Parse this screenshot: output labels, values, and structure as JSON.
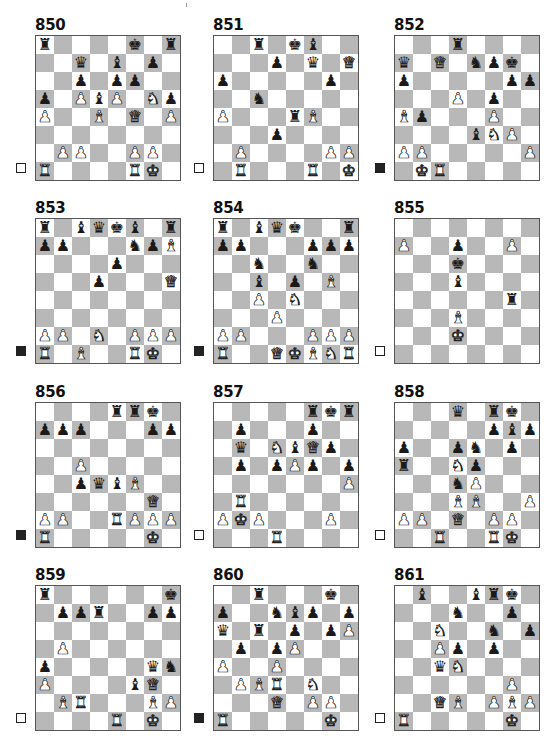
{
  "page": {
    "background": "#ffffff",
    "dark_square_color": "#b8b8b8",
    "light_square_color": "#ffffff"
  },
  "legend": {
    "white_to_move_icon": "white-square",
    "black_to_move_icon": "black-square"
  },
  "puzzles": [
    {
      "number": "850",
      "to_move": "white",
      "position": {
        "8": {
          "a": "bR",
          "f": "bK",
          "h": "bR"
        },
        "7": {
          "c": "bQ",
          "e": "bB",
          "g": "bP"
        },
        "6": {
          "c": "bP",
          "e": "bP",
          "f": "bP"
        },
        "5": {
          "a": "bP",
          "c": "wP",
          "d": "bB",
          "e": "wP",
          "g": "wN",
          "h": "bP"
        },
        "4": {
          "a": "wP",
          "d": "wB",
          "f": "wQ",
          "h": "wP"
        },
        "3": {},
        "2": {
          "b": "wP",
          "c": "wP",
          "f": "wP",
          "g": "wP"
        },
        "1": {
          "a": "wR",
          "f": "wR",
          "g": "wK"
        }
      }
    },
    {
      "number": "851",
      "to_move": "white",
      "position": {
        "8": {
          "c": "bR",
          "e": "bK",
          "f": "bB"
        },
        "7": {
          "d": "bP",
          "f": "bQ",
          "h": "wQ"
        },
        "6": {
          "a": "bP",
          "g": "bP"
        },
        "5": {
          "c": "bN"
        },
        "4": {
          "a": "wP",
          "e": "bR",
          "f": "wB"
        },
        "3": {
          "d": "bP"
        },
        "2": {
          "b": "wP",
          "g": "wP",
          "h": "wP"
        },
        "1": {
          "b": "wR",
          "f": "wR",
          "h": "wK"
        }
      }
    },
    {
      "number": "852",
      "to_move": "black",
      "position": {
        "8": {
          "d": "bR"
        },
        "7": {
          "a": "bQ",
          "c": "wQ",
          "e": "bN",
          "f": "bP",
          "g": "bK"
        },
        "6": {
          "a": "bP",
          "g": "bP",
          "h": "bP"
        },
        "5": {
          "d": "wP",
          "f": "bP"
        },
        "4": {
          "a": "wB",
          "b": "bP",
          "f": "wP"
        },
        "3": {
          "e": "bB",
          "f": "wN",
          "g": "wP"
        },
        "2": {
          "a": "wP",
          "b": "wP",
          "h": "wP"
        },
        "1": {
          "b": "wK",
          "c": "wR"
        }
      }
    },
    {
      "number": "853",
      "to_move": "black",
      "position": {
        "8": {
          "a": "bR",
          "c": "bB",
          "d": "bQ",
          "e": "bK",
          "f": "bB",
          "h": "bR"
        },
        "7": {
          "a": "bP",
          "b": "bP",
          "f": "bN",
          "g": "bP",
          "h": "wB"
        },
        "6": {
          "e": "bP"
        },
        "5": {
          "d": "bP",
          "h": "wQ"
        },
        "4": {},
        "3": {},
        "2": {
          "a": "wP",
          "b": "wP",
          "d": "wN",
          "f": "wP",
          "g": "wP",
          "h": "wP"
        },
        "1": {
          "a": "wR",
          "c": "wB",
          "f": "wR",
          "g": "wK"
        }
      }
    },
    {
      "number": "854",
      "to_move": "black",
      "position": {
        "8": {
          "a": "bR",
          "c": "bB",
          "d": "bQ",
          "e": "bK",
          "h": "bR"
        },
        "7": {
          "a": "bP",
          "b": "bP",
          "f": "bP",
          "g": "bP",
          "h": "bP"
        },
        "6": {
          "c": "bN",
          "f": "bN"
        },
        "5": {
          "c": "bB",
          "e": "bP",
          "g": "wB"
        },
        "4": {
          "c": "wP",
          "e": "wN"
        },
        "3": {
          "d": "wP"
        },
        "2": {
          "a": "wP",
          "b": "wP",
          "f": "wP",
          "g": "wP",
          "h": "wP"
        },
        "1": {
          "a": "wR",
          "d": "wQ",
          "e": "wK",
          "f": "wB",
          "g": "wN",
          "h": "wR"
        }
      }
    },
    {
      "number": "855",
      "to_move": "white",
      "position": {
        "8": {},
        "7": {
          "a": "wP",
          "d": "bP",
          "g": "wP"
        },
        "6": {
          "d": "bK"
        },
        "5": {
          "d": "bB"
        },
        "4": {
          "g": "bR"
        },
        "3": {
          "d": "wB"
        },
        "2": {
          "d": "wK"
        },
        "1": {}
      }
    },
    {
      "number": "856",
      "to_move": "black",
      "position": {
        "8": {
          "e": "bR",
          "f": "bR",
          "g": "bK"
        },
        "7": {
          "a": "bP",
          "b": "bP",
          "c": "bP",
          "g": "bP",
          "h": "bP"
        },
        "6": {},
        "5": {
          "c": "wP"
        },
        "4": {
          "c": "bP",
          "d": "bQ",
          "e": "bB",
          "f": "wB"
        },
        "3": {
          "g": "wQ"
        },
        "2": {
          "a": "wP",
          "b": "wP",
          "e": "wR",
          "f": "wP",
          "g": "wP",
          "h": "wP"
        },
        "1": {
          "a": "wR",
          "g": "wK"
        }
      }
    },
    {
      "number": "857",
      "to_move": "white",
      "position": {
        "8": {
          "f": "bR",
          "g": "bK",
          "h": "bR"
        },
        "7": {
          "b": "bP",
          "f": "bP"
        },
        "6": {
          "b": "bQ",
          "d": "wN",
          "e": "bB",
          "f": "wQ",
          "g": "bP"
        },
        "5": {
          "b": "bP",
          "d": "bP",
          "e": "wP",
          "f": "bP",
          "h": "bP"
        },
        "4": {
          "h": "wP"
        },
        "3": {
          "b": "wR"
        },
        "2": {
          "a": "wP",
          "b": "wK",
          "c": "wP",
          "g": "wP"
        },
        "1": {
          "d": "wR"
        }
      }
    },
    {
      "number": "858",
      "to_move": "white",
      "position": {
        "8": {
          "d": "bQ",
          "f": "bR",
          "g": "bK"
        },
        "7": {
          "f": "bP",
          "g": "bB",
          "h": "bP"
        },
        "6": {
          "a": "bP",
          "d": "bP",
          "e": "bN",
          "g": "bP"
        },
        "5": {
          "a": "bR",
          "d": "wN",
          "e": "bP"
        },
        "4": {
          "d": "bN",
          "e": "wP"
        },
        "3": {
          "d": "wB",
          "e": "wB",
          "h": "wP"
        },
        "2": {
          "a": "wP",
          "b": "wP",
          "d": "wQ",
          "f": "wP",
          "g": "wP"
        },
        "1": {
          "c": "wR",
          "f": "wR",
          "g": "wK"
        }
      }
    },
    {
      "number": "859",
      "to_move": "white",
      "position": {
        "8": {
          "a": "bR",
          "h": "bK"
        },
        "7": {
          "b": "bP",
          "c": "bP",
          "d": "bR",
          "g": "bP",
          "h": "bP"
        },
        "6": {},
        "5": {
          "b": "wP"
        },
        "4": {
          "a": "bP",
          "g": "bQ",
          "h": "bN"
        },
        "3": {
          "a": "wP",
          "f": "bB",
          "g": "wQ"
        },
        "2": {
          "b": "wB",
          "c": "wR",
          "g": "wB",
          "h": "wP"
        },
        "1": {
          "e": "wR",
          "g": "wK"
        }
      }
    },
    {
      "number": "860",
      "to_move": "black",
      "position": {
        "8": {
          "c": "bR",
          "g": "bK"
        },
        "7": {
          "a": "bP",
          "d": "bN",
          "e": "bB",
          "f": "bP",
          "h": "bP"
        },
        "6": {
          "a": "bQ",
          "c": "bR",
          "e": "bP",
          "g": "bP",
          "h": "wP"
        },
        "5": {
          "b": "bP",
          "d": "bP",
          "e": "wP"
        },
        "4": {
          "a": "wP",
          "d": "wP"
        },
        "3": {
          "b": "wP",
          "c": "wB",
          "d": "wR",
          "f": "wN"
        },
        "2": {
          "d": "wQ",
          "f": "wP",
          "g": "wP"
        },
        "1": {
          "a": "wR",
          "g": "wK"
        }
      }
    },
    {
      "number": "861",
      "to_move": "white",
      "position": {
        "8": {
          "b": "bB",
          "e": "bB",
          "f": "bR",
          "g": "bK"
        },
        "7": {
          "d": "bN",
          "g": "bP"
        },
        "6": {
          "c": "wN",
          "f": "bN",
          "h": "bP"
        },
        "5": {
          "c": "wP",
          "d": "bP",
          "f": "bP"
        },
        "4": {
          "c": "bQ",
          "d": "wN"
        },
        "3": {
          "g": "wP"
        },
        "2": {
          "c": "wQ",
          "d": "wB",
          "f": "wP",
          "g": "wB",
          "h": "wP"
        },
        "1": {
          "a": "wR",
          "g": "wK"
        }
      }
    }
  ],
  "piece_glyphs": {
    "K": "♚",
    "Q": "♛",
    "R": "♜",
    "B": "♝",
    "N": "♞",
    "P": "♟"
  },
  "piece_names": {
    "K": "king",
    "Q": "queen",
    "R": "rook",
    "B": "bishop",
    "N": "knight",
    "P": "pawn"
  }
}
